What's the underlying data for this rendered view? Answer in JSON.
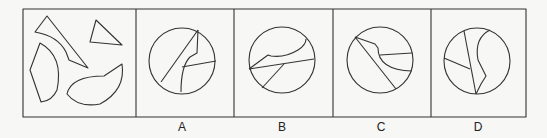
{
  "puzzle": {
    "question_panel": {
      "description": "four separate irregular pieces"
    },
    "options": [
      {
        "label": "A"
      },
      {
        "label": "B"
      },
      {
        "label": "C"
      },
      {
        "label": "D"
      }
    ],
    "colors": {
      "stroke": "#333333",
      "background": "#f7f7f5"
    }
  }
}
